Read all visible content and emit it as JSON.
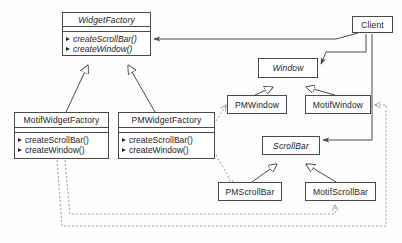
{
  "diagram": {
    "kind": "uml-class-diagram",
    "stroke_color": "#4a4a4a",
    "text_color": "#1c1c1c",
    "background": "#fdfdfd",
    "dashed_color": "#9a9a9a"
  },
  "classes": [
    {
      "id": "widget-factory",
      "name": "WidgetFactory",
      "abstract": true,
      "operations": [
        {
          "label": "createScrollBar()",
          "abstract": true
        },
        {
          "label": "createWindow()",
          "abstract": true
        }
      ],
      "x": 62,
      "y": 12,
      "width": 89,
      "height": 44,
      "title_height": 14,
      "has_empty_compartment": true
    },
    {
      "id": "motif-widget-factory",
      "name": "MotifWidgetFactory",
      "abstract": false,
      "operations": [
        {
          "label": "createScrollBar()",
          "abstract": false
        },
        {
          "label": "createWindow()",
          "abstract": false
        }
      ],
      "x": 14,
      "y": 112,
      "width": 95,
      "height": 47,
      "title_height": 15,
      "has_empty_compartment": true
    },
    {
      "id": "pm-widget-factory",
      "name": "PMWidgetFactory",
      "abstract": false,
      "operations": [
        {
          "label": "createScrollBar()",
          "abstract": false
        },
        {
          "label": "createWindow()",
          "abstract": false
        }
      ],
      "x": 118,
      "y": 112,
      "width": 97,
      "height": 47,
      "title_height": 15,
      "has_empty_compartment": true
    },
    {
      "id": "client",
      "name": "Client",
      "abstract": false,
      "operations": [],
      "x": 352,
      "y": 16,
      "width": 41,
      "height": 17,
      "title_height": 17,
      "has_empty_compartment": false
    },
    {
      "id": "window",
      "name": "Window",
      "abstract": true,
      "operations": [],
      "x": 258,
      "y": 58,
      "width": 60,
      "height": 20,
      "title_height": 20,
      "has_empty_compartment": false
    },
    {
      "id": "pm-window",
      "name": "PMWindow",
      "abstract": false,
      "operations": [],
      "x": 227,
      "y": 95,
      "width": 60,
      "height": 19,
      "title_height": 19,
      "has_empty_compartment": false
    },
    {
      "id": "motif-window",
      "name": "MotifWindow",
      "abstract": false,
      "operations": [],
      "x": 305,
      "y": 95,
      "width": 66,
      "height": 19,
      "title_height": 19,
      "has_empty_compartment": false
    },
    {
      "id": "scroll-bar",
      "name": "ScrollBar",
      "abstract": true,
      "operations": [],
      "x": 262,
      "y": 136,
      "width": 58,
      "height": 19,
      "title_height": 19,
      "has_empty_compartment": false
    },
    {
      "id": "pm-scroll-bar",
      "name": "PMScrollBar",
      "abstract": false,
      "operations": [],
      "x": 218,
      "y": 182,
      "width": 64,
      "height": 19,
      "title_height": 19,
      "has_empty_compartment": false
    },
    {
      "id": "motif-scroll-bar",
      "name": "MotifScrollBar",
      "abstract": false,
      "operations": [],
      "x": 305,
      "y": 182,
      "width": 71,
      "height": 19,
      "title_height": 19,
      "has_empty_compartment": false
    }
  ],
  "relationships": [
    {
      "id": "motif-factory-generalizes-widget-factory",
      "type": "generalization",
      "from": "motif-widget-factory",
      "to": "widget-factory"
    },
    {
      "id": "pm-factory-generalizes-widget-factory",
      "type": "generalization",
      "from": "pm-widget-factory",
      "to": "widget-factory"
    },
    {
      "id": "pm-window-generalizes-window",
      "type": "generalization",
      "from": "pm-window",
      "to": "window"
    },
    {
      "id": "motif-window-generalizes-window",
      "type": "generalization",
      "from": "motif-window",
      "to": "window"
    },
    {
      "id": "pm-scrollbar-generalizes-scrollbar",
      "type": "generalization",
      "from": "pm-scroll-bar",
      "to": "scroll-bar"
    },
    {
      "id": "motif-scrollbar-generalizes-scrollbar",
      "type": "generalization",
      "from": "motif-scroll-bar",
      "to": "scroll-bar"
    },
    {
      "id": "client-uses-widget-factory",
      "type": "association",
      "from": "client",
      "to": "widget-factory"
    },
    {
      "id": "client-uses-window",
      "type": "association",
      "from": "client",
      "to": "window"
    },
    {
      "id": "client-uses-scrollbar",
      "type": "association",
      "from": "client",
      "to": "scroll-bar"
    },
    {
      "id": "pm-factory-creates-pm-window",
      "type": "dependency",
      "from": "pm-widget-factory",
      "to": "pm-window"
    },
    {
      "id": "pm-factory-creates-pm-scrollbar",
      "type": "dependency",
      "from": "pm-widget-factory",
      "to": "pm-scroll-bar"
    },
    {
      "id": "motif-factory-creates-motif-window",
      "type": "dependency",
      "from": "motif-widget-factory",
      "to": "motif-window"
    },
    {
      "id": "motif-factory-creates-motif-scrollbar",
      "type": "dependency",
      "from": "motif-widget-factory",
      "to": "motif-scroll-bar"
    }
  ]
}
